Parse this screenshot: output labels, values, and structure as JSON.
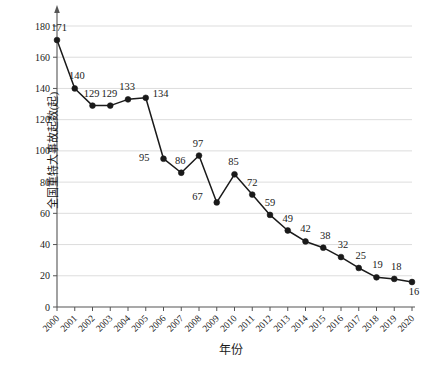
{
  "chart_data": {
    "type": "line",
    "title": "",
    "xlabel": "年份",
    "ylabel": "全国重特大事故起数(起)",
    "categories": [
      "2000",
      "2001",
      "2002",
      "2003",
      "2004",
      "2005",
      "2006",
      "2007",
      "2008",
      "2009",
      "2010",
      "2011",
      "2012",
      "2013",
      "2014",
      "2015",
      "2016",
      "2017",
      "2018",
      "2019",
      "2020"
    ],
    "values": [
      171,
      140,
      129,
      129,
      133,
      134,
      95,
      86,
      97,
      67,
      85,
      72,
      59,
      49,
      42,
      38,
      32,
      25,
      19,
      18,
      16
    ],
    "series": [
      {
        "name": "全国重特大事故起数",
        "values": [
          171,
          140,
          129,
          129,
          133,
          134,
          95,
          86,
          97,
          67,
          85,
          72,
          59,
          49,
          42,
          38,
          32,
          25,
          19,
          18,
          16
        ]
      }
    ],
    "ylim": [
      0,
      180
    ],
    "yticks": [
      0,
      20,
      40,
      60,
      80,
      100,
      120,
      140,
      160,
      180
    ],
    "ytick_labels": [
      "0",
      "20",
      "40",
      "60",
      "80",
      "100",
      "120",
      "140",
      "160",
      "180"
    ],
    "xtick_labels": [
      "2000",
      "2001",
      "2002",
      "2003",
      "2004",
      "2005",
      "2006",
      "2007",
      "2008",
      "2009",
      "2010",
      "2011",
      "2012",
      "2013",
      "2014",
      "2015",
      "2016",
      "2017",
      "2018",
      "2019",
      "2020"
    ],
    "grid": "horizontal",
    "legend": "none",
    "data_labels": [
      "171",
      "140",
      "129",
      "129",
      "133",
      "134",
      "95",
      "86",
      "97",
      "67",
      "85",
      "72",
      "59",
      "49",
      "42",
      "38",
      "32",
      "25",
      "19",
      "18",
      "16"
    ],
    "label_offsets": [
      {
        "dx": 2,
        "dy": -9
      },
      {
        "dx": 2,
        "dy": -9
      },
      {
        "dx": -1,
        "dy": -9
      },
      {
        "dx": -1,
        "dy": -9
      },
      {
        "dx": -1,
        "dy": -9
      },
      {
        "dx": 7,
        "dy": -1
      },
      {
        "dx": -14,
        "dy": 2
      },
      {
        "dx": -1,
        "dy": -9
      },
      {
        "dx": -1,
        "dy": -9
      },
      {
        "dx": -14,
        "dy": -2
      },
      {
        "dx": -1,
        "dy": -9
      },
      {
        "dx": 0,
        "dy": -9
      },
      {
        "dx": 0,
        "dy": -9
      },
      {
        "dx": 0,
        "dy": -9
      },
      {
        "dx": 0,
        "dy": -9
      },
      {
        "dx": 2,
        "dy": -9
      },
      {
        "dx": 2,
        "dy": -9
      },
      {
        "dx": 2,
        "dy": -9
      },
      {
        "dx": 1,
        "dy": -9
      },
      {
        "dx": 2,
        "dy": -9
      },
      {
        "dx": 2,
        "dy": 13
      }
    ],
    "colors": {
      "line": "#1a1a1a",
      "marker": "#1a1a1a",
      "grid": "#d9d9d9",
      "axis": "#555555",
      "text": "#1a1a1a",
      "background": "#ffffff"
    },
    "axis_arrow": true,
    "xtick_rotation": -45,
    "marker": "circle"
  }
}
